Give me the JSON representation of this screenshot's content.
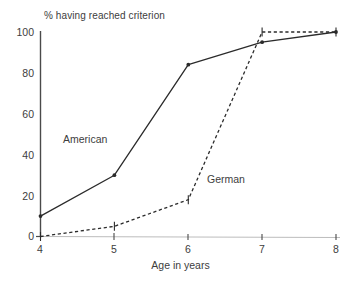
{
  "chart_data": {
    "type": "line",
    "title": "% having reached criterion",
    "xlabel": "Age in years",
    "ylabel": "",
    "xlim": [
      4,
      8
    ],
    "ylim": [
      0,
      100
    ],
    "grid": false,
    "legend_position": "inline-annotation",
    "xticks": [
      "4",
      "5",
      "6",
      "7",
      "8"
    ],
    "yticks": [
      "0",
      "20",
      "40",
      "60",
      "80",
      "100"
    ],
    "x": [
      4,
      5,
      6,
      7,
      8
    ],
    "series": [
      {
        "name": "American",
        "style": "solid",
        "color": "#2b2b2b",
        "values": [
          10,
          30,
          84,
          95,
          100
        ]
      },
      {
        "name": "German",
        "style": "dashed",
        "color": "#2b2b2b",
        "values": [
          0,
          5,
          18,
          100,
          100
        ]
      }
    ],
    "annotations": [
      {
        "text": "American",
        "x": 4.55,
        "y": 44
      },
      {
        "text": "German",
        "x": 6.45,
        "y": 26
      }
    ]
  },
  "axes": {
    "y_axis_label_0": "0",
    "y_axis_label_20": "20",
    "y_axis_label_40": "40",
    "y_axis_label_60": "60",
    "y_axis_label_80": "80",
    "y_axis_label_100": "100",
    "x_axis_label_4": "4",
    "x_axis_label_5": "5",
    "x_axis_label_6": "6",
    "x_axis_label_7": "7",
    "x_axis_label_8": "8"
  },
  "colors": {
    "line": "#2b2b2b",
    "axis": "#4a4a4a",
    "baseline": "#b9b9b9",
    "text": "#3d3d3d",
    "background": "#ffffff"
  }
}
